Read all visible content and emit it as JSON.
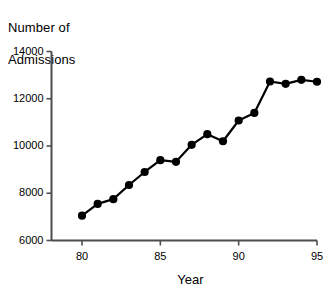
{
  "chart_data": {
    "type": "line",
    "title": "",
    "xlabel": "Year",
    "ylabel": "Number of Admissions",
    "ylabel_lines": [
      "Number of",
      "Admissions"
    ],
    "x": [
      80,
      81,
      82,
      83,
      84,
      85,
      86,
      87,
      88,
      89,
      90,
      91,
      92,
      93,
      94,
      95
    ],
    "values": [
      7050,
      7550,
      7750,
      8350,
      8900,
      9400,
      9330,
      10050,
      10500,
      10200,
      11080,
      11400,
      12730,
      12630,
      12800,
      12720
    ],
    "series": [
      {
        "name": "Admissions",
        "values": [
          7050,
          7550,
          7750,
          8350,
          8900,
          9400,
          9330,
          10050,
          10500,
          10200,
          11080,
          11400,
          12730,
          12630,
          12800,
          12720
        ]
      }
    ],
    "xlim": [
      79,
      95
    ],
    "ylim": [
      6000,
      14000
    ],
    "xticks": [
      80,
      85,
      90,
      95
    ],
    "xticklabels": [
      "80",
      "85",
      "90",
      "95"
    ],
    "yticks": [
      6000,
      8000,
      10000,
      12000,
      14000
    ],
    "yticklabels": [
      "6000",
      "8000",
      "10000",
      "12000",
      "14000"
    ],
    "grid": false,
    "legend": "none",
    "line_color": "#000000",
    "marker": "circle",
    "marker_color": "#000000",
    "axis_color": "#4d4d4d",
    "background": "#ffffff"
  }
}
